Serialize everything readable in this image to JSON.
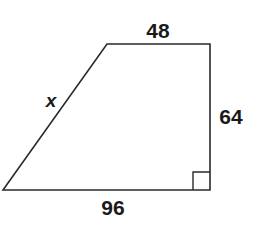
{
  "figure": {
    "shape": "right trapezoid",
    "vertices": {
      "top_left": [
        107,
        44
      ],
      "top_right": [
        210,
        44
      ],
      "bottom_right": [
        210,
        190
      ],
      "bottom_left": [
        3,
        190
      ]
    },
    "stroke_color": "#2a2a2a",
    "right_angle_marker": "bottom-right",
    "labels": {
      "top": "48",
      "right": "64",
      "bottom": "96",
      "slant": "x"
    }
  }
}
